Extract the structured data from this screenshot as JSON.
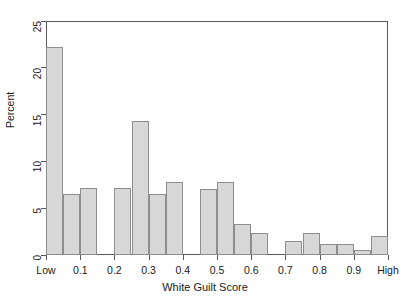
{
  "chart_data": {
    "type": "bar",
    "title": "",
    "xlabel": "White Guilt Score",
    "ylabel": "Percent",
    "ylim": [
      0,
      25
    ],
    "xlim": [
      0,
      1
    ],
    "grid": false,
    "legend": null,
    "y_ticks": [
      0,
      5,
      10,
      15,
      20,
      25
    ],
    "y_tick_labels": [
      "0",
      "5",
      "10",
      "15",
      "20",
      "25"
    ],
    "x_ticks": [
      0.0,
      0.1,
      0.2,
      0.3,
      0.4,
      0.5,
      0.6,
      0.7,
      0.8,
      0.9,
      1.0
    ],
    "x_tick_labels": [
      "Low",
      "0.1",
      "0.2",
      "0.3",
      "0.4",
      "0.5",
      "0.6",
      "0.7",
      "0.8",
      "0.9",
      "High"
    ],
    "bar_fill_color": "#d7d7d7",
    "bar_edge_color": "#8e8e8e",
    "axis_color": "#5a5a5a",
    "background_color": "#ffffff",
    "bin_width": 0.05,
    "bins": [
      {
        "x_left": 0.0,
        "x_right": 0.05,
        "value": 22.2
      },
      {
        "x_left": 0.05,
        "x_right": 0.1,
        "value": 6.5
      },
      {
        "x_left": 0.1,
        "x_right": 0.15,
        "value": 7.2
      },
      {
        "x_left": 0.15,
        "x_right": 0.2,
        "value": 0.0
      },
      {
        "x_left": 0.2,
        "x_right": 0.25,
        "value": 7.2
      },
      {
        "x_left": 0.25,
        "x_right": 0.3,
        "value": 14.3
      },
      {
        "x_left": 0.3,
        "x_right": 0.35,
        "value": 6.5
      },
      {
        "x_left": 0.35,
        "x_right": 0.4,
        "value": 7.8
      },
      {
        "x_left": 0.4,
        "x_right": 0.45,
        "value": 0.0
      },
      {
        "x_left": 0.45,
        "x_right": 0.5,
        "value": 7.0
      },
      {
        "x_left": 0.5,
        "x_right": 0.55,
        "value": 7.8
      },
      {
        "x_left": 0.55,
        "x_right": 0.6,
        "value": 3.3
      },
      {
        "x_left": 0.6,
        "x_right": 0.65,
        "value": 2.4
      },
      {
        "x_left": 0.65,
        "x_right": 0.7,
        "value": 0.0
      },
      {
        "x_left": 0.7,
        "x_right": 0.75,
        "value": 1.5
      },
      {
        "x_left": 0.75,
        "x_right": 0.8,
        "value": 2.4
      },
      {
        "x_left": 0.8,
        "x_right": 0.85,
        "value": 1.2
      },
      {
        "x_left": 0.85,
        "x_right": 0.9,
        "value": 1.2
      },
      {
        "x_left": 0.9,
        "x_right": 0.95,
        "value": 0.5
      },
      {
        "x_left": 0.95,
        "x_right": 1.0,
        "value": 2.0
      }
    ]
  }
}
